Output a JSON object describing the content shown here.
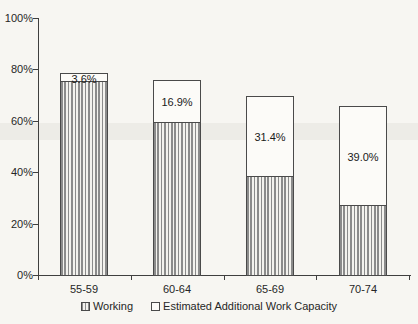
{
  "chart_data": {
    "type": "bar",
    "stacked": true,
    "title": "",
    "xlabel": "",
    "ylabel": "",
    "categories": [
      "55-59",
      "60-64",
      "65-69",
      "70-74"
    ],
    "series": [
      {
        "name": "Working",
        "swatch": "striped-square-icon",
        "pattern": "vertical-stripes",
        "values": [
          75,
          59,
          38,
          27
        ]
      },
      {
        "name": "Estimated Additional Work Capacity",
        "swatch": "white-square-icon",
        "pattern": "plain-white",
        "values": [
          3.6,
          16.9,
          31.4,
          39.0
        ],
        "data_labels": [
          "3.6%",
          "16.9%",
          "31.4%",
          "39.0%"
        ]
      }
    ],
    "ylim": [
      0,
      100
    ],
    "yticks": [
      "0%",
      "20%",
      "40%",
      "60%",
      "80%",
      "100%"
    ],
    "grid": false,
    "legend_position": "bottom"
  },
  "colors": {
    "background": "#f7f6f2",
    "axis": "#3f3f3f",
    "bar_border": "#4a4a4a",
    "stripe": "#8b8b8b",
    "bar_fill": "#fcfbf8",
    "text": "#1e1e1e"
  }
}
